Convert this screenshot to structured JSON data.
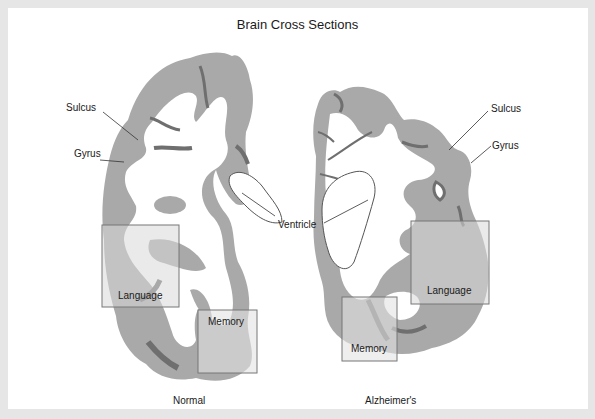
{
  "title": "Brain Cross Sections",
  "colors": {
    "page_background": "#e6e6e6",
    "panel": "#ffffff",
    "gray_matter": "#a9a9a9",
    "white_matter": "#ffffff",
    "deep_shadow": "#6f6f6f",
    "region_box_fill": "#d9d9d9",
    "region_box_stroke": "#777777",
    "leader_line": "#333333"
  },
  "left_section": {
    "caption": "Normal",
    "labels": {
      "sulcus": "Sulcus",
      "gyrus": "Gyrus"
    },
    "regions": {
      "language": "Language",
      "memory": "Memory"
    }
  },
  "right_section": {
    "caption": "Alzheimer's",
    "labels": {
      "sulcus": "Sulcus",
      "gyrus": "Gyrus"
    },
    "regions": {
      "language": "Language",
      "memory": "Memory"
    }
  },
  "shared_labels": {
    "ventricle": "Ventricle"
  }
}
